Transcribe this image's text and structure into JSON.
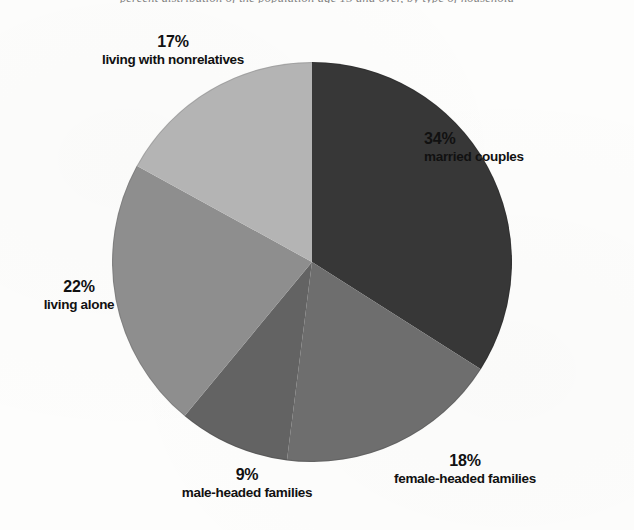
{
  "figure": {
    "title": "percent distribution of the population age 15 and over, by type of household",
    "background_color": "#fdfdfc"
  },
  "chart_data": {
    "type": "pie",
    "title": "percent distribution of the population age 15 and over, by type of household",
    "xlabel": "",
    "ylabel": "",
    "units": "percent",
    "start_angle_deg": 0,
    "direction": "clockwise",
    "legend": "none (direct labels)",
    "grid": false,
    "categories": [
      "married couples",
      "female-headed families",
      "male-headed families",
      "living alone",
      "living with nonrelatives"
    ],
    "values": [
      34,
      18,
      9,
      22,
      17
    ],
    "value_labels": [
      "34%",
      "18%",
      "9%",
      "22%",
      "17%"
    ],
    "colors": [
      "#373737",
      "#6e6e6e",
      "#636363",
      "#8e8e8e",
      "#b4b4b4"
    ],
    "slices": [
      {
        "label": "married couples",
        "percent_text": "34%",
        "value": 34,
        "color": "#373737",
        "start_deg": 0,
        "end_deg": 122.4
      },
      {
        "label": "female-headed families",
        "percent_text": "18%",
        "value": 18,
        "color": "#6e6e6e",
        "start_deg": 122.4,
        "end_deg": 187.2
      },
      {
        "label": "male-headed families",
        "percent_text": "9%",
        "value": 9,
        "color": "#636363",
        "start_deg": 187.2,
        "end_deg": 219.6
      },
      {
        "label": "living alone",
        "percent_text": "22%",
        "value": 22,
        "color": "#8e8e8e",
        "start_deg": 219.6,
        "end_deg": 298.8
      },
      {
        "label": "living with nonrelatives",
        "percent_text": "17%",
        "value": 17,
        "color": "#b4b4b4",
        "start_deg": 298.8,
        "end_deg": 360
      }
    ]
  },
  "labels": {
    "nonrelatives": {
      "percent": "17%",
      "name": "living with nonrelatives"
    },
    "married": {
      "percent": "34%",
      "name": "married couples"
    },
    "alone": {
      "percent": "22%",
      "name": "living alone"
    },
    "male": {
      "percent": "9%",
      "name": "male-headed families"
    },
    "female": {
      "percent": "18%",
      "name": "female-headed families"
    }
  }
}
